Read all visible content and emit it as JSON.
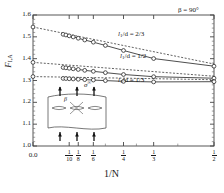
{
  "chart_data": {
    "type": "line",
    "title": "",
    "xlabel": "1/N",
    "ylabel": "F",
    "ylabel_sub": "I,A",
    "annotation": "β = 90°",
    "xlim": [
      0.0,
      0.5
    ],
    "ylim": [
      1.0,
      1.6
    ],
    "grid": false,
    "legend": "inline-labels",
    "xticks": [
      {
        "value": 0.0,
        "label": "0.0",
        "kind": "decimal"
      },
      {
        "value": 0.1,
        "label": "1/10",
        "kind": "fraction",
        "num": "1",
        "den": "10"
      },
      {
        "value": 0.125,
        "label": "1/8",
        "kind": "fraction",
        "num": "1",
        "den": "8"
      },
      {
        "value": 0.1667,
        "label": "1/6",
        "kind": "fraction",
        "num": "1",
        "den": "6"
      },
      {
        "value": 0.25,
        "label": "1/4",
        "kind": "fraction",
        "num": "1",
        "den": "4"
      },
      {
        "value": 0.3333,
        "label": "1/3",
        "kind": "fraction",
        "num": "1",
        "den": "3"
      },
      {
        "value": 0.5,
        "label": "1/2",
        "kind": "fraction",
        "num": "1",
        "den": "2"
      }
    ],
    "yticks": [
      "1.0",
      "1.1",
      "1.2",
      "1.3",
      "1.4",
      "1.5",
      "1.6"
    ],
    "series": [
      {
        "name": "l₁/d = 2/3",
        "label": "l",
        "label_sub": "1",
        "label_rest": "/d = 2/3",
        "intercept": 1.545,
        "solid_points": [
          {
            "x": 0.0833,
            "y": 1.5115
          },
          {
            "x": 0.0909,
            "y": 1.5085
          },
          {
            "x": 0.1,
            "y": 1.5045
          },
          {
            "x": 0.1111,
            "y": 1.4995
          },
          {
            "x": 0.125,
            "y": 1.4935
          },
          {
            "x": 0.1429,
            "y": 1.4855
          },
          {
            "x": 0.1667,
            "y": 1.4755
          },
          {
            "x": 0.2,
            "y": 1.4605
          },
          {
            "x": 0.25,
            "y": 1.4375
          },
          {
            "x": 0.3333,
            "y": 1.4005
          },
          {
            "x": 0.5,
            "y": 1.3655
          }
        ],
        "dashed_from": {
          "x": 0.0,
          "y": 1.545
        },
        "dashed_to": {
          "x": 0.5,
          "y": 1.3755
        }
      },
      {
        "name": "l₁/d = 1/2",
        "label": "l",
        "label_sub": "1",
        "label_rest": "/d = 1/2",
        "intercept": 1.383,
        "solid_points": [
          {
            "x": 0.0833,
            "y": 1.3595
          },
          {
            "x": 0.0909,
            "y": 1.358
          },
          {
            "x": 0.1,
            "y": 1.356
          },
          {
            "x": 0.1111,
            "y": 1.3535
          },
          {
            "x": 0.125,
            "y": 1.3505
          },
          {
            "x": 0.1429,
            "y": 1.3465
          },
          {
            "x": 0.1667,
            "y": 1.342
          },
          {
            "x": 0.2,
            "y": 1.336
          },
          {
            "x": 0.25,
            "y": 1.3275
          },
          {
            "x": 0.3333,
            "y": 1.3175
          },
          {
            "x": 0.5,
            "y": 1.3105
          }
        ],
        "dashed_from": {
          "x": 0.0,
          "y": 1.383
        },
        "dashed_to": {
          "x": 0.5,
          "y": 1.3195
        }
      },
      {
        "name": "l₁/d = 1/3",
        "label": "l",
        "label_sub": "1",
        "label_rest": "/d = 1/3",
        "intercept": 1.318,
        "solid_points": [
          {
            "x": 0.0833,
            "y": 1.3095
          },
          {
            "x": 0.0909,
            "y": 1.309
          },
          {
            "x": 0.1,
            "y": 1.308
          },
          {
            "x": 0.1111,
            "y": 1.307
          },
          {
            "x": 0.125,
            "y": 1.3055
          },
          {
            "x": 0.1429,
            "y": 1.304
          },
          {
            "x": 0.1667,
            "y": 1.302
          },
          {
            "x": 0.2,
            "y": 1.2995
          },
          {
            "x": 0.25,
            "y": 1.296
          },
          {
            "x": 0.3333,
            "y": 1.2935
          },
          {
            "x": 0.5,
            "y": 1.2945
          }
        ],
        "dashed_from": {
          "x": 0.0,
          "y": 1.318
        },
        "dashed_to": {
          "x": 0.5,
          "y": 1.3035
        }
      }
    ]
  },
  "inset": {
    "stress_label": "σ",
    "stress_sup": "∞",
    "angle_label": "β",
    "crack_count": 3,
    "arrow_count_top": 3,
    "arrow_count_bottom": 3
  }
}
